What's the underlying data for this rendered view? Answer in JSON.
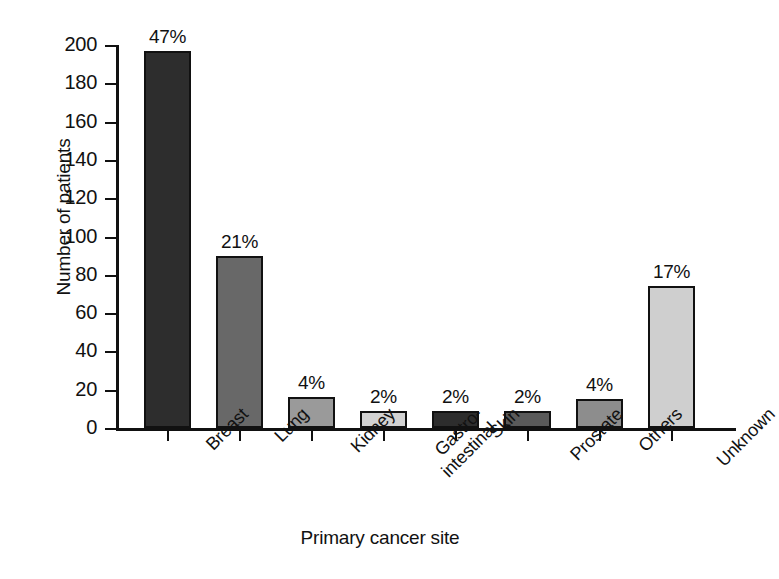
{
  "chart_data": {
    "type": "bar",
    "title": "",
    "xlabel": "Primary cancer site",
    "ylabel": "Number of patients",
    "categories": [
      "Breast",
      "Lung",
      "Kidney",
      "Gastro-intestinal",
      "Skin",
      "Prostate",
      "Others",
      "Unknown"
    ],
    "category_lines": [
      [
        "Breast"
      ],
      [
        "Lung"
      ],
      [
        "Kidney"
      ],
      [
        "Gastro-",
        "intestinal"
      ],
      [
        "Skin"
      ],
      [
        "Prostate"
      ],
      [
        "Others"
      ],
      [
        "Unknown"
      ]
    ],
    "values": [
      197,
      90,
      16,
      9,
      9,
      9,
      15,
      74
    ],
    "data_labels": [
      "47%",
      "21%",
      "4%",
      "2%",
      "2%",
      "2%",
      "4%",
      "17%"
    ],
    "bar_colors": [
      "#2d2d2d",
      "#686868",
      "#9a9a9a",
      "#d2d2d2",
      "#2d2d2d",
      "#5a5a5a",
      "#8d8d8d",
      "#cfcfcf"
    ],
    "bar_edge_color": "#111111",
    "ylim": [
      0,
      200
    ],
    "yticks": [
      0,
      20,
      40,
      60,
      80,
      100,
      120,
      140,
      160,
      180,
      200
    ],
    "ytick_labels": [
      "0",
      "20",
      "40",
      "60",
      "80",
      "100",
      "120",
      "140",
      "160",
      "180",
      "200"
    ],
    "grid": false,
    "legend": false,
    "background_color": "#ffffff",
    "axis_color": "#111111"
  }
}
